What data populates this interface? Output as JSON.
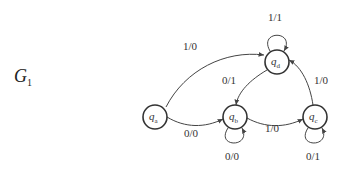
{
  "diagram": {
    "title": {
      "main": "G",
      "subscript": "1"
    },
    "states": [
      {
        "id": "qa",
        "base": "q",
        "sub": "a"
      },
      {
        "id": "qb",
        "base": "q",
        "sub": "b"
      },
      {
        "id": "qc",
        "base": "q",
        "sub": "c"
      },
      {
        "id": "qd",
        "base": "q",
        "sub": "d"
      }
    ],
    "transitions": [
      {
        "from": "qa",
        "to": "qd",
        "label": "1/0"
      },
      {
        "from": "qa",
        "to": "qb",
        "label": "0/0"
      },
      {
        "from": "qb",
        "to": "qb",
        "label": "0/0"
      },
      {
        "from": "qb",
        "to": "qc",
        "label": "1/0"
      },
      {
        "from": "qc",
        "to": "qc",
        "label": "0/1"
      },
      {
        "from": "qc",
        "to": "qd",
        "label": "1/0"
      },
      {
        "from": "qd",
        "to": "qb",
        "label": "0/1"
      },
      {
        "from": "qd",
        "to": "qd",
        "label": "1/1"
      }
    ]
  }
}
